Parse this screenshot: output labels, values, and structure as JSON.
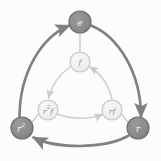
{
  "figure": {
    "background_color": "#fcfcfc"
  },
  "colors": {
    "outer_node_fill": "#8a8a8a",
    "outer_node_stroke": "#6f6f6f",
    "outer_edge": "#808080",
    "inner_node_fill": "#f0f0f0",
    "inner_node_stroke": "#c2c2c2",
    "inner_edge": "#cfcfcf",
    "spoke_edge": "#b9b9b9",
    "outer_label_color": "#f2f2f2",
    "inner_label_color": "#8d8d8d"
  },
  "nodes": {
    "outer": [
      {
        "id": "e",
        "label": "e",
        "sup": "",
        "cx": 80,
        "cy": 22,
        "r": 11
      },
      {
        "id": "r2",
        "label": "r",
        "sup": "2",
        "cx": 22,
        "cy": 128,
        "r": 11
      },
      {
        "id": "r",
        "label": "r",
        "sup": "",
        "cx": 138,
        "cy": 128,
        "r": 11
      }
    ],
    "inner": [
      {
        "id": "f",
        "label": "f",
        "sup": "",
        "pre": "",
        "cx": 80,
        "cy": 62,
        "r": 10
      },
      {
        "id": "r2f",
        "label": "r",
        "sup": "2",
        "post": "f",
        "cx": 48,
        "cy": 110,
        "r": 10
      },
      {
        "id": "rf",
        "label": "r",
        "sup": "",
        "post": "f",
        "cx": 112,
        "cy": 110,
        "r": 10
      }
    ]
  },
  "edges": {
    "outer": [
      {
        "id": "r2-to-e",
        "from": "r2",
        "to": "e",
        "directed": true,
        "style": "thick-curve"
      },
      {
        "id": "e-to-r",
        "from": "e",
        "to": "r",
        "directed": true,
        "style": "thick-curve"
      },
      {
        "id": "r-to-r2",
        "from": "r",
        "to": "r2",
        "directed": true,
        "style": "thick-curve"
      }
    ],
    "inner": [
      {
        "id": "f-to-r2f",
        "from": "f",
        "to": "r2f",
        "directed": true,
        "style": "thin-curve"
      },
      {
        "id": "r2f-to-rf",
        "from": "r2f",
        "to": "rf",
        "directed": true,
        "style": "thin-curve"
      },
      {
        "id": "rf-to-f",
        "from": "rf",
        "to": "f",
        "directed": true,
        "style": "thin-curve"
      }
    ],
    "spokes": [
      {
        "id": "e-f",
        "from": "e",
        "to": "f",
        "directed": false,
        "style": "thin-line"
      },
      {
        "id": "r2-r2f",
        "from": "r2",
        "to": "r2f",
        "directed": false,
        "style": "thin-line"
      },
      {
        "id": "r-rf",
        "from": "r",
        "to": "rf",
        "directed": false,
        "style": "thin-line"
      }
    ]
  },
  "labels": {
    "e": "e",
    "r2_base": "r",
    "r2_sup": "2",
    "r": "r",
    "f": "f",
    "r2f_base": "r",
    "r2f_sup": "2",
    "r2f_post": "f",
    "rf_base": "r",
    "rf_post": "f"
  }
}
